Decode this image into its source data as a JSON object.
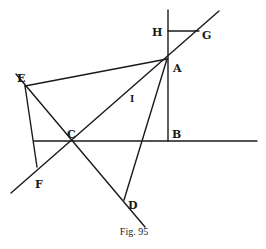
{
  "figure": {
    "caption": "Fig. 95",
    "ink_color": "#1a1a1a",
    "background": "#ffffff"
  },
  "points": {
    "A": {
      "label": "A",
      "x": 167,
      "y": 59
    },
    "B": {
      "label": "B",
      "x": 168,
      "y": 141
    },
    "C": {
      "label": "C",
      "x": 72,
      "y": 141
    },
    "D": {
      "label": "D",
      "x": 124,
      "y": 200
    },
    "E": {
      "label": "E",
      "x": 25,
      "y": 86
    },
    "F": {
      "label": "F",
      "x": 37,
      "y": 167
    },
    "G": {
      "label": "G",
      "x": 199,
      "y": 31
    },
    "H": {
      "label": "H",
      "x": 168,
      "y": 31
    },
    "I": {
      "label": "I",
      "x": 133,
      "y": 98
    }
  },
  "segments": [
    {
      "name": "vertical-line-HB",
      "from": "H",
      "to": "B"
    },
    {
      "name": "horizontal-line-HG",
      "from": "H",
      "to": "G"
    },
    {
      "name": "line-FCAG",
      "from": "F",
      "to": "G"
    },
    {
      "name": "line-EA",
      "from": "E",
      "to": "A"
    },
    {
      "name": "line-AD",
      "from": "A",
      "to": "D"
    },
    {
      "name": "line-ECD",
      "from": "E",
      "to": "D"
    },
    {
      "name": "line-EF",
      "from": "E",
      "to": "F"
    },
    {
      "name": "horizontal-line-CB",
      "from": "C",
      "to": "B"
    }
  ]
}
